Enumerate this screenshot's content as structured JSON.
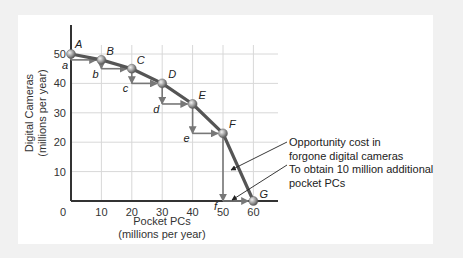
{
  "chart_data": {
    "type": "line",
    "title": "",
    "xlabel": "Pocket PCs",
    "xlabel_sub": "(millions per year)",
    "ylabel": "Digital Cameras",
    "ylabel_sub": "(millions per year)",
    "x_ticks": [
      "0",
      "10",
      "20",
      "30",
      "40",
      "50",
      "60"
    ],
    "y_ticks": [
      "10",
      "20",
      "30",
      "40",
      "50"
    ],
    "xlim": [
      0,
      68
    ],
    "ylim": [
      0,
      58
    ],
    "grid": true,
    "series": [
      {
        "name": "Production possibilities frontier",
        "points": [
          {
            "label": "A",
            "x": 0,
            "y": 50
          },
          {
            "label": "B",
            "x": 10,
            "y": 48
          },
          {
            "label": "C",
            "x": 20,
            "y": 45
          },
          {
            "label": "D",
            "x": 30,
            "y": 40
          },
          {
            "label": "E",
            "x": 40,
            "y": 33
          },
          {
            "label": "F",
            "x": 50,
            "y": 23
          },
          {
            "label": "G",
            "x": 60,
            "y": 0
          }
        ]
      }
    ],
    "step_labels": [
      "a",
      "b",
      "c",
      "d",
      "e",
      "f"
    ],
    "annotations": [
      {
        "text_line1": "Opportunity cost in",
        "text_line2": "forgone digital cameras"
      },
      {
        "text_line1": "To obtain 10 million additional",
        "text_line2": "pocket PCs"
      }
    ]
  },
  "colors": {
    "curve": "#555555",
    "step_arrows": "#777777",
    "grid": "#d8d8d8",
    "axis": "#333333",
    "point": "#9a9a9a"
  }
}
